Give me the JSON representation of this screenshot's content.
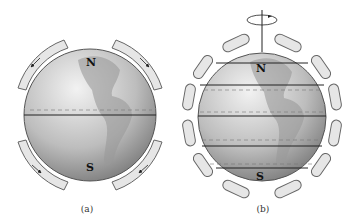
{
  "figure": {
    "panels": [
      {
        "id": "a",
        "caption": "(a)",
        "description": "Single-cell circulation model on a non-rotating Earth",
        "labels": {
          "north": "N",
          "south": "S"
        },
        "cells_per_hemisphere": 1
      },
      {
        "id": "b",
        "caption": "(b)",
        "description": "Three-cell circulation model on a rotating Earth",
        "labels": {
          "north": "N",
          "south": "S"
        },
        "cells_per_hemisphere": 3,
        "rotation_arrow": "counterclockwise rotation about axis"
      }
    ]
  },
  "colors": {
    "globe_light": "#d9d9d9",
    "globe_dark": "#8a8a8a",
    "cell_fill": "#e6e6e6",
    "cell_stroke": "#555555",
    "line": "#222222"
  }
}
